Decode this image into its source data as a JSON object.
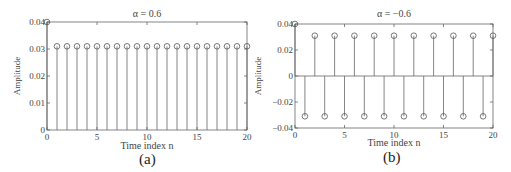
{
  "chart_data": [
    {
      "type": "stem",
      "title": "α = 0.6",
      "xlabel": "Time index n",
      "ylabel": "Amplitude",
      "xlim": [
        0,
        20
      ],
      "ylim": [
        0,
        0.04
      ],
      "xticks": [
        "0",
        "5",
        "10",
        "15",
        "20"
      ],
      "yticks": [
        "0",
        "0.01",
        "0.02",
        "0.03",
        "0.04"
      ],
      "grid": false,
      "x": [
        0,
        1,
        2,
        3,
        4,
        5,
        6,
        7,
        8,
        9,
        10,
        11,
        12,
        13,
        14,
        15,
        16,
        17,
        18,
        19,
        20
      ],
      "values": [
        0.04,
        0.031,
        0.031,
        0.031,
        0.031,
        0.031,
        0.031,
        0.031,
        0.031,
        0.031,
        0.031,
        0.031,
        0.031,
        0.031,
        0.031,
        0.031,
        0.031,
        0.031,
        0.031,
        0.031,
        0.031
      ],
      "caption": "(a)"
    },
    {
      "type": "stem",
      "title": "α = −0.6",
      "xlabel": "Time index n",
      "ylabel": "Amplitude",
      "xlim": [
        0,
        20
      ],
      "ylim": [
        -0.04,
        0.04
      ],
      "xticks": [
        "0",
        "5",
        "10",
        "15",
        "20"
      ],
      "yticks": [
        "−0.04",
        "−0.02",
        "0",
        "0.02",
        "0.04"
      ],
      "grid": false,
      "x": [
        0,
        1,
        2,
        3,
        4,
        5,
        6,
        7,
        8,
        9,
        10,
        11,
        12,
        13,
        14,
        15,
        16,
        17,
        18,
        19,
        20
      ],
      "values": [
        0.04,
        -0.031,
        0.031,
        -0.031,
        0.031,
        -0.031,
        0.031,
        -0.031,
        0.031,
        -0.031,
        0.031,
        -0.031,
        0.031,
        -0.031,
        0.031,
        -0.031,
        0.031,
        -0.031,
        0.031,
        -0.031,
        0.031
      ],
      "caption": "(b)"
    }
  ],
  "panels": {
    "a": {
      "title": "α = 0.6",
      "xlabel": "Time index n",
      "ylabel": "Amplitude",
      "caption": "(a)",
      "yticks": [
        "0",
        "0.01",
        "0.02",
        "0.03",
        "0.04"
      ],
      "xticks": [
        "0",
        "5",
        "10",
        "15",
        "20"
      ]
    },
    "b": {
      "title": "α = −0.6",
      "xlabel": "Time index n",
      "ylabel": "Amplitude",
      "caption": "(b)",
      "yticks": [
        "−0.04",
        "−0.02",
        "0",
        "0.02",
        "0.04"
      ],
      "xticks": [
        "0",
        "5",
        "10",
        "15",
        "20"
      ]
    }
  },
  "colors": {
    "axis": "#555555",
    "stem": "#666666",
    "marker": "#555555"
  }
}
